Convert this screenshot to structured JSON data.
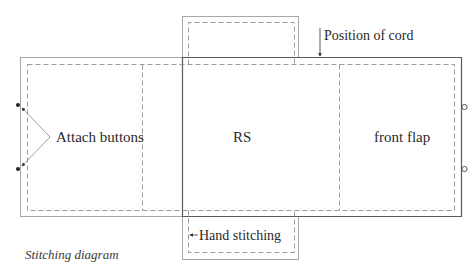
{
  "diagram": {
    "caption": "Stitching diagram",
    "labels": {
      "attach_buttons": "Attach buttons",
      "rs": "RS",
      "front_flap": "front flap",
      "position_of_cord": "Position of cord",
      "hand_stitching": "Hand stitching"
    },
    "colors": {
      "outline": "#9a9a9a",
      "dark_outline": "#555555",
      "dashed": "#8f8f8f",
      "text": "#2a2a2a"
    }
  }
}
